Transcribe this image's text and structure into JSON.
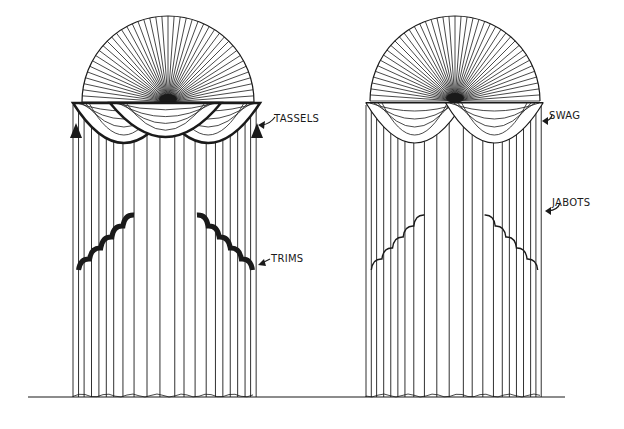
{
  "figure": {
    "title": "",
    "background": "#ffffff",
    "ink_color": "#1a1a1a",
    "ground_line": {
      "x1": 28,
      "x2": 565,
      "y": 397
    }
  },
  "drapes": [
    {
      "id": "left",
      "description": "Arched fan top with swag valance, tassels and trimmed jabots",
      "fan": {
        "cx": 168,
        "cy": 102,
        "r": 86
      },
      "valance": {
        "x1": 73,
        "x2": 260,
        "y": 103
      },
      "curtain": {
        "x1": 73,
        "x2": 258,
        "bottom": 397
      },
      "labels": [
        {
          "id": "tassels",
          "text": "TASSELS",
          "x": 274,
          "y": 113
        },
        {
          "id": "trims",
          "text": "TRIMS",
          "x": 271,
          "y": 253
        }
      ]
    },
    {
      "id": "right",
      "description": "Arched fan top with swag valance and plain jabots",
      "fan": {
        "cx": 455,
        "cy": 101,
        "r": 85
      },
      "valance": {
        "x1": 366,
        "x2": 543,
        "y": 103
      },
      "curtain": {
        "x1": 366,
        "x2": 543,
        "bottom": 397
      },
      "labels": [
        {
          "id": "swag",
          "text": "SWAG",
          "x": 549,
          "y": 110
        },
        {
          "id": "jabots",
          "text": "JABOTS",
          "x": 552,
          "y": 197
        }
      ]
    }
  ]
}
